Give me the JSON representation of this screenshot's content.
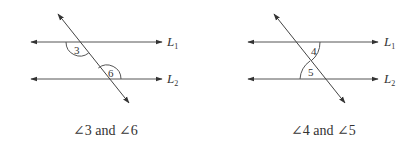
{
  "figures": [
    {
      "id": "left",
      "line_labels": [
        {
          "name": "L",
          "sub": "1"
        },
        {
          "name": "L",
          "sub": "2"
        }
      ],
      "angles": [
        "3",
        "6"
      ],
      "caption": "∠3 and ∠6"
    },
    {
      "id": "right",
      "line_labels": [
        {
          "name": "L",
          "sub": "1"
        },
        {
          "name": "L",
          "sub": "2"
        }
      ],
      "angles": [
        "4",
        "5"
      ],
      "caption": "∠4 and ∠5"
    }
  ],
  "colors": {
    "line": "#444444",
    "text": "#333333",
    "background": "#ffffff"
  }
}
